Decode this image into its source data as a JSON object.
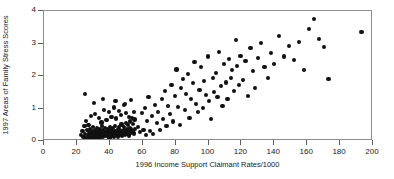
{
  "chart_data": {
    "type": "scatter",
    "title": "",
    "xlabel": "1996 Income Support Claimant Rates/1000",
    "ylabel": "1997 Areas of Family Stress Scores",
    "xlim": [
      0,
      200
    ],
    "ylim": [
      0,
      4
    ],
    "xticks": [
      0,
      20,
      40,
      60,
      80,
      100,
      120,
      140,
      160,
      180,
      200
    ],
    "yticks": [
      0,
      1,
      2,
      3,
      4
    ],
    "xtick_labels": [
      "0",
      "20",
      "40",
      "60",
      "80",
      "100",
      "120",
      "140",
      "160",
      "180",
      "200"
    ],
    "ytick_labels": [
      "0",
      "1",
      "2",
      "3",
      "4"
    ],
    "grid": false,
    "legend": null,
    "marker": "filled-diamond",
    "marker_color": "#111111",
    "frame_color": "#8d8d8d",
    "series": [
      {
        "name": "wards",
        "points": [
          [
            22.5,
            0.18
          ],
          [
            23.4,
            0.3
          ],
          [
            24.0,
            0.12
          ],
          [
            24.6,
            0.45
          ],
          [
            25.1,
            0.22
          ],
          [
            25.4,
            0.62
          ],
          [
            25.8,
            0.08
          ],
          [
            26.2,
            0.33
          ],
          [
            26.6,
            0.19
          ],
          [
            27.0,
            0.5
          ],
          [
            27.3,
            0.27
          ],
          [
            27.7,
            0.11
          ],
          [
            28.0,
            0.38
          ],
          [
            28.3,
            0.21
          ],
          [
            28.7,
            0.07
          ],
          [
            29.0,
            0.3
          ],
          [
            29.4,
            0.16
          ],
          [
            29.8,
            0.44
          ],
          [
            30.1,
            0.24
          ],
          [
            30.4,
            0.1
          ],
          [
            30.8,
            0.35
          ],
          [
            31.1,
            0.2
          ],
          [
            31.5,
            0.28
          ],
          [
            31.8,
            0.13
          ],
          [
            32.1,
            0.41
          ],
          [
            32.5,
            0.23
          ],
          [
            32.8,
            0.09
          ],
          [
            33.1,
            0.31
          ],
          [
            33.5,
            0.17
          ],
          [
            33.8,
            0.26
          ],
          [
            34.1,
            0.37
          ],
          [
            34.4,
            0.14
          ],
          [
            34.8,
            0.29
          ],
          [
            35.1,
            0.2
          ],
          [
            35.4,
            0.46
          ],
          [
            35.8,
            0.12
          ],
          [
            36.1,
            0.33
          ],
          [
            36.4,
            0.24
          ],
          [
            36.8,
            0.18
          ],
          [
            37.1,
            0.4
          ],
          [
            37.4,
            0.27
          ],
          [
            37.8,
            0.15
          ],
          [
            38.1,
            0.31
          ],
          [
            38.4,
            0.22
          ],
          [
            38.8,
            0.36
          ],
          [
            39.1,
            0.19
          ],
          [
            39.4,
            0.28
          ],
          [
            39.8,
            0.11
          ],
          [
            40.1,
            0.43
          ],
          [
            40.4,
            0.25
          ],
          [
            40.8,
            0.34
          ],
          [
            41.1,
            0.17
          ],
          [
            41.4,
            0.29
          ],
          [
            41.8,
            0.21
          ],
          [
            42.1,
            0.39
          ],
          [
            42.4,
            0.13
          ],
          [
            42.8,
            0.32
          ],
          [
            43.1,
            0.26
          ],
          [
            43.4,
            0.47
          ],
          [
            43.8,
            0.18
          ],
          [
            44.1,
            0.3
          ],
          [
            44.4,
            0.23
          ],
          [
            44.8,
            0.36
          ],
          [
            45.1,
            0.14
          ],
          [
            45.4,
            0.28
          ],
          [
            45.8,
            0.42
          ],
          [
            46.1,
            0.2
          ],
          [
            46.4,
            0.33
          ],
          [
            46.8,
            0.25
          ],
          [
            47.1,
            0.51
          ],
          [
            47.4,
            0.16
          ],
          [
            47.8,
            0.31
          ],
          [
            48.1,
            0.24
          ],
          [
            48.4,
            0.44
          ],
          [
            48.8,
            0.35
          ],
          [
            49.1,
            0.19
          ],
          [
            49.4,
            0.29
          ],
          [
            49.8,
            0.55
          ],
          [
            50.1,
            0.22
          ],
          [
            50.4,
            0.38
          ],
          [
            50.8,
            0.27
          ],
          [
            51.1,
            0.48
          ],
          [
            51.4,
            0.32
          ],
          [
            51.8,
            0.17
          ],
          [
            52.1,
            0.6
          ],
          [
            52.4,
            0.41
          ],
          [
            52.8,
            0.26
          ],
          [
            53.1,
            0.36
          ],
          [
            53.4,
            0.72
          ],
          [
            53.8,
            0.3
          ],
          [
            54.1,
            0.52
          ],
          [
            54.5,
            0.23
          ],
          [
            55.0,
            0.66
          ],
          [
            55.4,
            0.38
          ],
          [
            24.8,
            1.45
          ],
          [
            28.5,
            0.78
          ],
          [
            31.0,
            0.83
          ],
          [
            33.6,
            0.7
          ],
          [
            35.0,
            0.57
          ],
          [
            36.5,
            0.95
          ],
          [
            38.0,
            0.64
          ],
          [
            39.6,
            0.88
          ],
          [
            41.0,
            0.75
          ],
          [
            42.6,
            1.03
          ],
          [
            44.0,
            0.69
          ],
          [
            45.6,
            0.92
          ],
          [
            47.0,
            0.8
          ],
          [
            48.6,
            1.1
          ],
          [
            50.0,
            0.86
          ],
          [
            51.6,
            0.74
          ],
          [
            53.0,
            1.25
          ],
          [
            54.6,
            0.9
          ],
          [
            30.5,
            1.18
          ],
          [
            36.0,
            1.3
          ],
          [
            43.5,
            1.22
          ],
          [
            49.0,
            1.15
          ],
          [
            57.0,
            0.44
          ],
          [
            58.5,
            0.28
          ],
          [
            59.5,
            0.85
          ],
          [
            60.5,
            0.35
          ],
          [
            61.5,
            1.02
          ],
          [
            62.0,
            0.18
          ],
          [
            62.8,
            0.62
          ],
          [
            63.5,
            1.35
          ],
          [
            64.5,
            0.3
          ],
          [
            65.5,
            0.78
          ],
          [
            66.5,
            0.22
          ],
          [
            67.5,
            1.12
          ],
          [
            68.5,
            0.55
          ],
          [
            69.5,
            0.9
          ],
          [
            70.5,
            0.33
          ],
          [
            71.5,
            1.28
          ],
          [
            72.5,
            0.68
          ],
          [
            73.5,
            1.55
          ],
          [
            74.5,
            0.47
          ],
          [
            75.5,
            1.08
          ],
          [
            76.5,
            0.82
          ],
          [
            77.5,
            1.72
          ],
          [
            78.5,
            0.6
          ],
          [
            79.5,
            1.38
          ],
          [
            80.5,
            2.2
          ],
          [
            81.5,
            1.05
          ],
          [
            82.5,
            0.5
          ],
          [
            83.5,
            1.62
          ],
          [
            84.5,
            1.9
          ],
          [
            85.5,
            0.95
          ],
          [
            86.5,
            1.45
          ],
          [
            87.5,
            2.05
          ],
          [
            88.5,
            0.72
          ],
          [
            89.5,
            1.3
          ],
          [
            90.5,
            1.78
          ],
          [
            91.5,
            2.42
          ],
          [
            92.5,
            1.15
          ],
          [
            93.5,
            0.88
          ],
          [
            94.5,
            1.58
          ],
          [
            95.5,
            2.28
          ],
          [
            96.5,
            1.02
          ],
          [
            97.5,
            1.85
          ],
          [
            98.5,
            1.42
          ],
          [
            99.5,
            2.6
          ],
          [
            100.5,
            1.22
          ],
          [
            101.5,
            0.68
          ],
          [
            102.5,
            1.95
          ],
          [
            103.5,
            1.5
          ],
          [
            104.5,
            2.1
          ],
          [
            105.5,
            1.35
          ],
          [
            106.5,
            2.75
          ],
          [
            107.5,
            1.68
          ],
          [
            108.5,
            1.08
          ],
          [
            109.5,
            2.38
          ],
          [
            110.5,
            1.8
          ],
          [
            111.5,
            1.28
          ],
          [
            112.5,
            2.52
          ],
          [
            113.5,
            1.95
          ],
          [
            114.5,
            2.18
          ],
          [
            115.5,
            1.55
          ],
          [
            116.5,
            3.1
          ],
          [
            117.5,
            2.3
          ],
          [
            118.5,
            1.72
          ],
          [
            119.5,
            2.62
          ],
          [
            121.0,
            1.88
          ],
          [
            122.5,
            2.45
          ],
          [
            124.0,
            1.38
          ],
          [
            125.5,
            2.85
          ],
          [
            127.0,
            2.15
          ],
          [
            128.5,
            1.62
          ],
          [
            130.0,
            2.55
          ],
          [
            132.0,
            3.02
          ],
          [
            134.0,
            2.28
          ],
          [
            136.0,
            1.95
          ],
          [
            138.0,
            2.7
          ],
          [
            140.0,
            2.38
          ],
          [
            143.0,
            3.22
          ],
          [
            146.0,
            2.6
          ],
          [
            149.0,
            2.92
          ],
          [
            152.0,
            2.48
          ],
          [
            155.0,
            3.05
          ],
          [
            158.0,
            2.18
          ],
          [
            161.0,
            3.45
          ],
          [
            164.0,
            3.75
          ],
          [
            167.0,
            3.15
          ],
          [
            170.0,
            2.88
          ],
          [
            173.0,
            1.92
          ],
          [
            193.0,
            3.35
          ]
        ]
      }
    ]
  }
}
